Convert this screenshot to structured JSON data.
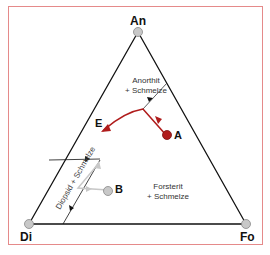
{
  "diagram": {
    "type": "ternary-phase-diagram",
    "vertices": {
      "top": "An",
      "bottom_left": "Di",
      "bottom_right": "Fo"
    },
    "fields": {
      "anorthit": [
        "Anorthit",
        "+ Schmelze"
      ],
      "forsterit": [
        "Forsterit",
        "+ Schmelze"
      ],
      "diopsid": "Diopsid + Schmelze"
    },
    "points": {
      "eutectic": "E",
      "a": "A",
      "b": "B"
    },
    "colors": {
      "frame": "#e58a8a",
      "path_a": "#b01c1c",
      "point_a": "#b01c1c",
      "path_b": "#c8c8c8",
      "vertex_marker": "#c8c8c8",
      "edges": "#111111"
    }
  }
}
